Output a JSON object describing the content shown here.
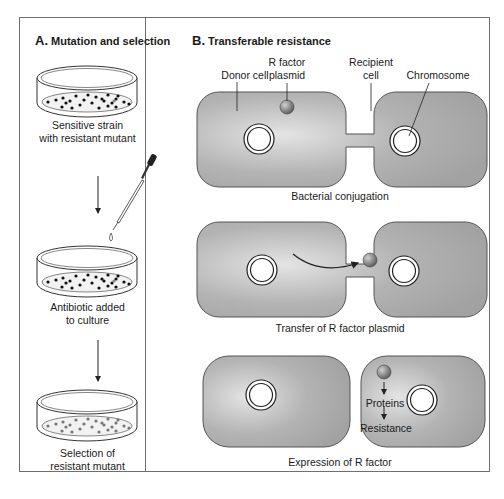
{
  "panel_a": {
    "letter": "A.",
    "title": "Mutation and selection",
    "steps": [
      {
        "caption_line1": "Sensitive strain",
        "caption_line2": "with resistant mutant"
      },
      {
        "caption_line1": "Antibiotic added",
        "caption_line2": "to culture"
      },
      {
        "caption_line1": "Selection of",
        "caption_line2": "resistant mutant"
      }
    ]
  },
  "panel_b": {
    "letter": "B.",
    "title": "Transferable resistance",
    "labels": {
      "donor_cell": "Donor cell",
      "r_factor_line1": "R factor",
      "r_factor_line2": "plasmid",
      "recipient_line1": "Recipient",
      "recipient_line2": "cell",
      "chromosome": "Chromosome"
    },
    "stages": [
      {
        "caption": "Bacterial conjugation"
      },
      {
        "caption": "Transfer of R factor plasmid"
      },
      {
        "caption": "Expression of R factor",
        "inner_labels": [
          "Proteins",
          "Resistance"
        ]
      }
    ]
  },
  "colors": {
    "cell_fill": "#a9a9a9",
    "cell_highlight": "#e2e2e2",
    "plasmid": "#7a7a7a",
    "frame": "#6f6f6f",
    "colony_dark": "#111111",
    "colony_gray": "#7a7a7a"
  }
}
